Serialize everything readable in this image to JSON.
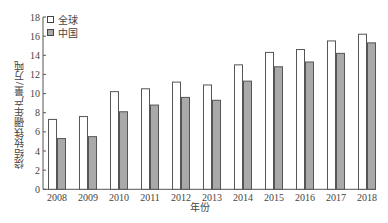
{
  "chart_data": {
    "type": "bar",
    "title": "",
    "xlabel": "年份",
    "ylabel": "烧结钕铁硼年产量/万吨",
    "categories": [
      "2008",
      "2009",
      "2010",
      "2011",
      "2012",
      "2013",
      "2014",
      "2015",
      "2016",
      "2017",
      "2018"
    ],
    "series": [
      {
        "name": "全球",
        "color": "#ffffff",
        "values": [
          7.3,
          7.6,
          10.2,
          10.5,
          11.2,
          10.9,
          13.0,
          14.3,
          14.6,
          15.5,
          16.2
        ]
      },
      {
        "name": "中国",
        "color": "#a9a9a9",
        "values": [
          5.3,
          5.5,
          8.1,
          8.8,
          9.6,
          9.3,
          11.3,
          12.8,
          13.3,
          14.2,
          15.3
        ]
      }
    ],
    "ylim": [
      0,
      18
    ],
    "yticks": [
      0,
      2,
      4,
      6,
      8,
      10,
      12,
      14,
      16,
      18
    ],
    "grid": false,
    "legend_position": "top-left"
  },
  "legend": {
    "items": [
      {
        "label": "全球",
        "color": "#ffffff"
      },
      {
        "label": "中国",
        "color": "#a9a9a9"
      }
    ]
  },
  "axes": {
    "xlabel": "年份",
    "ylabel": "烧结钕铁硼年产量/万吨"
  }
}
